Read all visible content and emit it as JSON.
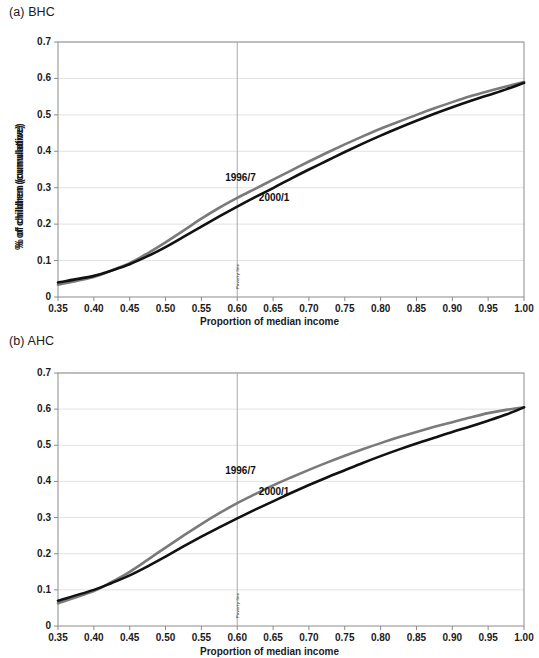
{
  "figure": {
    "background_color": "#ffffff",
    "panels": [
      {
        "key": "bhc",
        "title": "(a) BHC",
        "xlabel": "Proportion of median income",
        "ylabel": "% of children (cumulative)",
        "poverty_line_label": "Poverty line"
      },
      {
        "key": "ahc",
        "title": "(b) AHC",
        "xlabel": "Proportion of median income",
        "ylabel": "% of children (cumulative)",
        "poverty_line_label": "Poverty line"
      }
    ]
  },
  "colors": {
    "series_1996_7": "#7a7a7a",
    "series_2000_1": "#111111",
    "gridline": "#e2e2e2",
    "axis": "#8c8c8c",
    "poverty_line": "#a8a8a8",
    "text": "#1a1a1a"
  },
  "chart_data": [
    {
      "type": "line",
      "title": "(a) BHC",
      "xlabel": "Proportion of median income",
      "ylabel": "% of children (cumulative)",
      "xlim": [
        0.35,
        1.0
      ],
      "ylim": [
        0.0,
        0.7
      ],
      "xticks": [
        0.35,
        0.4,
        0.45,
        0.5,
        0.55,
        0.6,
        0.65,
        0.7,
        0.75,
        0.8,
        0.85,
        0.9,
        0.95,
        1.0
      ],
      "xtick_labels": [
        "0.35",
        "0.40",
        "0.45",
        "0.50",
        "0.55",
        "0.60",
        "0.65",
        "0.70",
        "0.75",
        "0.80",
        "0.85",
        "0.90",
        "0.95",
        "1.00"
      ],
      "yticks": [
        0,
        0.1,
        0.2,
        0.3,
        0.4,
        0.5,
        0.6,
        0.7
      ],
      "ytick_labels": [
        "0",
        "0.1",
        "0.2",
        "0.3",
        "0.4",
        "0.5",
        "0.6",
        "0.7"
      ],
      "grid": true,
      "legend_position": "inline-annotation",
      "annotations": [
        {
          "text": "1996/7",
          "x": 0.625,
          "y": 0.325
        },
        {
          "text": "2000/1",
          "x": 0.672,
          "y": 0.268
        },
        {
          "text": "Poverty line",
          "x": 0.6,
          "y": 0.055,
          "rotation": -90
        }
      ],
      "x": [
        0.35,
        0.4,
        0.425,
        0.45,
        0.475,
        0.5,
        0.525,
        0.55,
        0.575,
        0.6,
        0.625,
        0.65,
        0.675,
        0.7,
        0.725,
        0.75,
        0.775,
        0.8,
        0.825,
        0.85,
        0.875,
        0.9,
        0.925,
        0.95,
        0.975,
        1.0
      ],
      "series": [
        {
          "name": "1996/7",
          "color": "#7a7a7a",
          "values": [
            0.034,
            0.055,
            0.073,
            0.093,
            0.12,
            0.15,
            0.182,
            0.215,
            0.245,
            0.272,
            0.297,
            0.322,
            0.347,
            0.372,
            0.396,
            0.419,
            0.441,
            0.462,
            0.481,
            0.5,
            0.518,
            0.535,
            0.551,
            0.565,
            0.578,
            0.59
          ]
        },
        {
          "name": "2000/1",
          "color": "#111111",
          "values": [
            0.04,
            0.058,
            0.073,
            0.09,
            0.112,
            0.137,
            0.165,
            0.193,
            0.221,
            0.248,
            0.274,
            0.299,
            0.325,
            0.35,
            0.374,
            0.398,
            0.421,
            0.443,
            0.464,
            0.484,
            0.503,
            0.521,
            0.538,
            0.554,
            0.57,
            0.588
          ]
        }
      ]
    },
    {
      "type": "line",
      "title": "(b) AHC",
      "xlabel": "Proportion of median income",
      "ylabel": "% of children (cumulative)",
      "xlim": [
        0.35,
        1.0
      ],
      "ylim": [
        0.0,
        0.7
      ],
      "xticks": [
        0.35,
        0.4,
        0.45,
        0.5,
        0.55,
        0.6,
        0.65,
        0.7,
        0.75,
        0.8,
        0.85,
        0.9,
        0.95,
        1.0
      ],
      "xtick_labels": [
        "0.35",
        "0.40",
        "0.45",
        "0.50",
        "0.55",
        "0.60",
        "0.65",
        "0.70",
        "0.75",
        "0.80",
        "0.85",
        "0.90",
        "0.95",
        "1.00"
      ],
      "yticks": [
        0,
        0.1,
        0.2,
        0.3,
        0.4,
        0.5,
        0.6,
        0.7
      ],
      "ytick_labels": [
        "0",
        "0.1",
        "0.2",
        "0.3",
        "0.4",
        "0.5",
        "0.6",
        "0.7"
      ],
      "grid": true,
      "legend_position": "inline-annotation",
      "annotations": [
        {
          "text": "1996/7",
          "x": 0.625,
          "y": 0.425
        },
        {
          "text": "2000/1",
          "x": 0.672,
          "y": 0.368
        },
        {
          "text": "Poverty line",
          "x": 0.6,
          "y": 0.055,
          "rotation": -90
        }
      ],
      "x": [
        0.35,
        0.4,
        0.425,
        0.45,
        0.475,
        0.5,
        0.525,
        0.55,
        0.575,
        0.6,
        0.625,
        0.65,
        0.675,
        0.7,
        0.725,
        0.75,
        0.775,
        0.8,
        0.825,
        0.85,
        0.875,
        0.9,
        0.925,
        0.95,
        0.975,
        1.0
      ],
      "series": [
        {
          "name": "1996/7",
          "color": "#7a7a7a",
          "values": [
            0.063,
            0.097,
            0.122,
            0.15,
            0.183,
            0.217,
            0.25,
            0.282,
            0.312,
            0.34,
            0.365,
            0.389,
            0.411,
            0.432,
            0.452,
            0.471,
            0.489,
            0.506,
            0.522,
            0.537,
            0.551,
            0.564,
            0.577,
            0.589,
            0.598,
            0.605
          ]
        },
        {
          "name": "2000/1",
          "color": "#111111",
          "values": [
            0.07,
            0.1,
            0.119,
            0.14,
            0.165,
            0.192,
            0.22,
            0.247,
            0.273,
            0.298,
            0.322,
            0.345,
            0.368,
            0.39,
            0.411,
            0.431,
            0.451,
            0.47,
            0.488,
            0.505,
            0.521,
            0.537,
            0.552,
            0.568,
            0.585,
            0.605
          ]
        }
      ]
    }
  ]
}
